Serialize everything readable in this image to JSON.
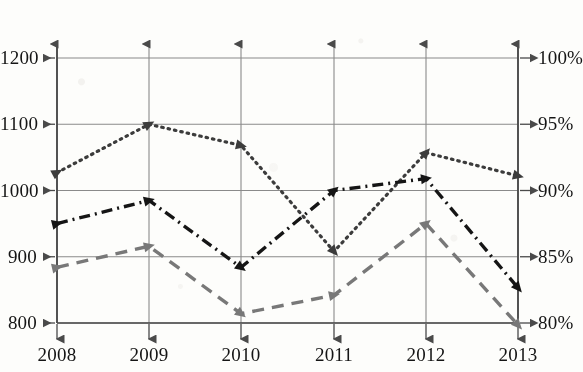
{
  "chart_data": {
    "type": "line",
    "title": "",
    "subtitle": "",
    "xlabel": "",
    "ylabel": "",
    "grid": true,
    "legend": "none",
    "categories": [
      "2008",
      "2009",
      "2010",
      "2011",
      "2012",
      "2013"
    ],
    "x_tick_labels": [
      "2008",
      "2009",
      "2010",
      "2011",
      "2012",
      "2013"
    ],
    "y_left_tick_labels": [
      "1200",
      "1100",
      "1000",
      "900",
      "800"
    ],
    "y_right_tick_labels": [
      "100%",
      "95%",
      "90%",
      "85%",
      "80%"
    ],
    "ylim": [
      800,
      1200
    ],
    "y_right_lim": [
      80,
      100
    ],
    "y_left_ticks": [
      1200,
      1100,
      1000,
      900,
      800
    ],
    "y_right_ticks": [
      100,
      95,
      90,
      85,
      80
    ],
    "series": [
      {
        "name": "dotted-series",
        "line_style": "dotted",
        "color": "#3c3c3c",
        "marker": "triangle",
        "axis": "left",
        "values": [
          1027,
          1100,
          1068,
          908,
          1057,
          1022
        ]
      },
      {
        "name": "dash-dot-series",
        "line_style": "dash-dot",
        "color": "#151515",
        "marker": "triangle",
        "axis": "left",
        "values": [
          950,
          985,
          884,
          1000,
          1018,
          853
        ]
      },
      {
        "name": "dashed-series",
        "line_style": "dashed",
        "color": "#787878",
        "marker": "triangle",
        "axis": "left",
        "values": [
          884,
          916,
          814,
          842,
          950,
          797
        ]
      }
    ]
  },
  "axes": {
    "left_axis_name": "left-value-axis",
    "right_axis_name": "right-percent-axis",
    "bottom_axis_name": "year-axis"
  },
  "geometry": {
    "plot_left": 57,
    "plot_right": 518,
    "plot_top": 58,
    "plot_bottom": 323,
    "x_positions": [
      57,
      149,
      241,
      334,
      426,
      518
    ],
    "y_positions": [
      58,
      124,
      190,
      257,
      323
    ]
  },
  "colors": {
    "axis": "#4a4a4a",
    "grid": "#8a8a8a",
    "dotted": "#3c3c3c",
    "dash_dot": "#151515",
    "dashed": "#787878",
    "background": "#fdfdfb",
    "text": "#151515"
  }
}
